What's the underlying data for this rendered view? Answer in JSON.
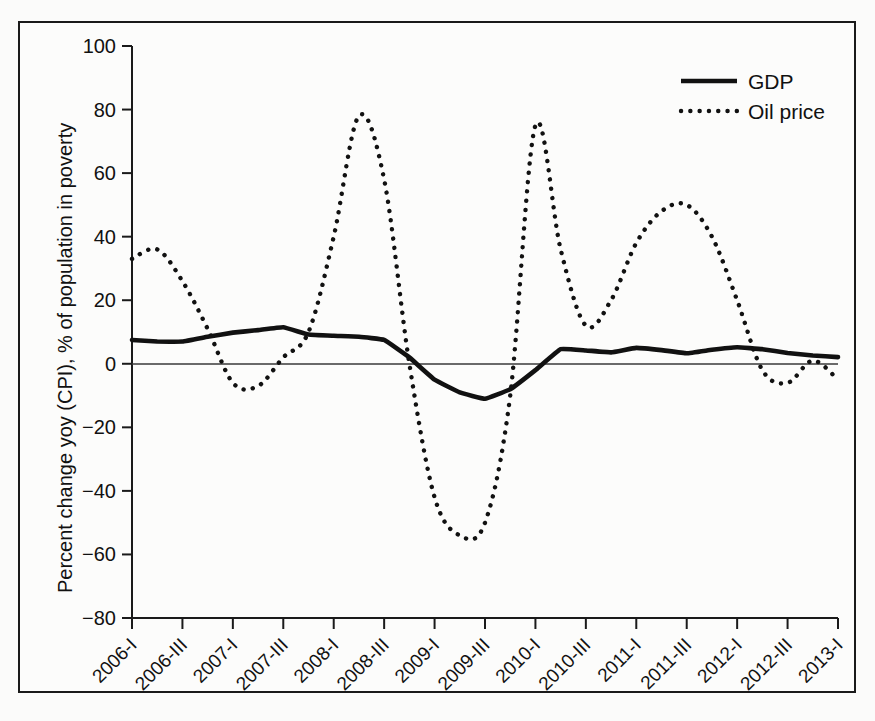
{
  "chart_data": {
    "type": "line",
    "title": "",
    "xlabel": "",
    "ylabel": "Percent change yoy (CPI), % of population in poverty",
    "ylim": [
      -80,
      100
    ],
    "yticks": [
      100,
      80,
      60,
      40,
      20,
      0,
      -20,
      -40,
      -60,
      -80
    ],
    "ytick_labels": [
      "100",
      "80",
      "60",
      "40",
      "20",
      "0",
      "−20",
      "−40",
      "−60",
      "−80"
    ],
    "grid": false,
    "legend_position": "top-right",
    "zero_line": true,
    "x": [
      "2006-I",
      "2006-II",
      "2006-III",
      "2006-IV",
      "2007-I",
      "2007-II",
      "2007-III",
      "2007-IV",
      "2008-I",
      "2008-II",
      "2008-III",
      "2008-IV",
      "2009-I",
      "2009-II",
      "2009-III",
      "2009-IV",
      "2010-I",
      "2010-II",
      "2010-III",
      "2010-IV",
      "2011-I",
      "2011-II",
      "2011-III",
      "2011-IV",
      "2012-I",
      "2012-II",
      "2012-III",
      "2012-IV",
      "2013-I"
    ],
    "xtick_labels": [
      "2006-I",
      "2006-III",
      "2007-I",
      "2007-III",
      "2008-I",
      "2008-III",
      "2009-I",
      "2009-III",
      "2010-I",
      "2010-III",
      "2011-I",
      "2011-III",
      "2012-I",
      "2012-III",
      "2013-I"
    ],
    "xtick_label_rotation": -45,
    "series": [
      {
        "name": "GDP",
        "style": "solid",
        "color": "#111111",
        "values": [
          7.5,
          7.0,
          7.0,
          8.5,
          9.8,
          10.6,
          11.5,
          9.2,
          8.8,
          8.5,
          7.5,
          2.0,
          -5.0,
          -9.0,
          -11.0,
          -8.0,
          -2.0,
          4.6,
          4.2,
          3.6,
          5.0,
          4.3,
          3.3,
          4.4,
          5.2,
          4.6,
          3.4,
          2.6,
          2.1
        ]
      },
      {
        "name": "Oil price",
        "style": "dotted",
        "color": "#111111",
        "values": [
          33.0,
          36.0,
          26.0,
          11.0,
          -6.0,
          -7.0,
          2.0,
          10.0,
          40.0,
          78.0,
          58.0,
          0.0,
          -42.0,
          -54.0,
          -50.0,
          -10.0,
          75.0,
          36.0,
          12.0,
          20.0,
          38.0,
          48.0,
          50.0,
          40.0,
          20.0,
          -2.0,
          -6.0,
          1.0,
          -5.0
        ]
      }
    ],
    "legend": [
      {
        "label": "GDP",
        "style": "solid"
      },
      {
        "label": "Oil price",
        "style": "dotted"
      }
    ]
  }
}
